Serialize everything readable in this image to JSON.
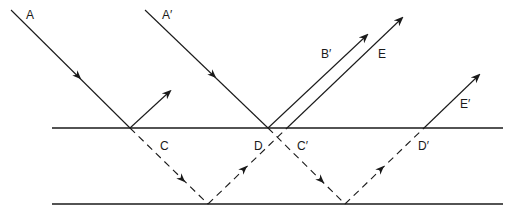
{
  "diagram": {
    "type": "thin-film-interference",
    "colors": {
      "line": "#1a1a1a",
      "background": "#ffffff"
    },
    "labels": {
      "A": "A",
      "A_prime": "A′",
      "B_prime": "B′",
      "E": "E",
      "C": "C",
      "D": "D",
      "C_prime": "C′",
      "D_prime": "D′",
      "E_prime": "E′"
    },
    "surfaces": [
      {
        "name": "top-surface",
        "y": 128,
        "x1": 52,
        "x2": 503
      },
      {
        "name": "bottom-surface",
        "y": 204,
        "x1": 52,
        "x2": 503
      }
    ]
  }
}
